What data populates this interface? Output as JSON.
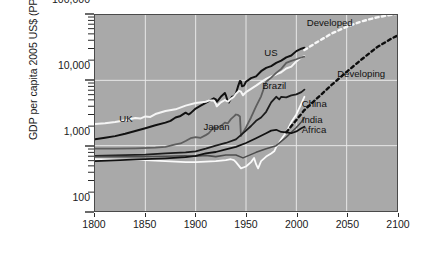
{
  "chart_data": {
    "type": "line",
    "title": "",
    "xlabel": "",
    "ylabel": "GDP per capita 2005 US$ (PPP)",
    "xlim": [
      1800,
      2100
    ],
    "ylim": [
      100,
      100000
    ],
    "yscale": "log",
    "grid": true,
    "legend_position": "inline-annotations",
    "background": "#a9a9a9",
    "gridline_color": "#e8e8e8",
    "xticks": [
      1800,
      1850,
      1900,
      1950,
      2000,
      2050,
      2100
    ],
    "xtick_labels": [
      "1800",
      "1850",
      "1900",
      "1950",
      "2000",
      "2050",
      "2100"
    ],
    "yticks": [
      100,
      1000,
      10000,
      100000
    ],
    "ytick_labels": [
      "100",
      "1,000",
      "10,000",
      "100,000"
    ],
    "annotations": [
      {
        "text": "UK",
        "x": 1825,
        "y": 2600,
        "color": "#111111"
      },
      {
        "text": "Japan",
        "x": 1908,
        "y": 1950,
        "color": "#111111"
      },
      {
        "text": "US",
        "x": 1968,
        "y": 26000,
        "color": "#111111"
      },
      {
        "text": "Brazil",
        "x": 1966,
        "y": 8200,
        "color": "#111111"
      },
      {
        "text": "China",
        "x": 2005,
        "y": 4300,
        "color": "#111111"
      },
      {
        "text": "India",
        "x": 2005,
        "y": 2450,
        "color": "#111111"
      },
      {
        "text": "Africa",
        "x": 2005,
        "y": 1750,
        "color": "#111111"
      },
      {
        "text": "Developed",
        "x": 2010,
        "y": 74000,
        "color": "#111111"
      },
      {
        "text": "Developing",
        "x": 2040,
        "y": 12500,
        "color": "#111111"
      }
    ],
    "series": [
      {
        "name": "US",
        "color": "#111111",
        "style": "solid",
        "width": 2.0,
        "points": [
          [
            1800,
            1250
          ],
          [
            1810,
            1320
          ],
          [
            1820,
            1400
          ],
          [
            1830,
            1520
          ],
          [
            1840,
            1680
          ],
          [
            1850,
            1850
          ],
          [
            1860,
            2050
          ],
          [
            1870,
            2250
          ],
          [
            1875,
            2400
          ],
          [
            1880,
            2700
          ],
          [
            1885,
            2850
          ],
          [
            1890,
            3200
          ],
          [
            1893,
            3000
          ],
          [
            1895,
            3150
          ],
          [
            1900,
            3700
          ],
          [
            1905,
            4100
          ],
          [
            1910,
            4500
          ],
          [
            1913,
            4800
          ],
          [
            1918,
            5300
          ],
          [
            1920,
            5100
          ],
          [
            1921,
            4700
          ],
          [
            1925,
            5600
          ],
          [
            1929,
            6400
          ],
          [
            1930,
            5900
          ],
          [
            1932,
            4700
          ],
          [
            1933,
            4600
          ],
          [
            1936,
            5600
          ],
          [
            1938,
            5700
          ],
          [
            1940,
            6300
          ],
          [
            1942,
            8000
          ],
          [
            1944,
            9800
          ],
          [
            1945,
            9600
          ],
          [
            1946,
            8100
          ],
          [
            1948,
            8300
          ],
          [
            1950,
            9500
          ],
          [
            1955,
            10800
          ],
          [
            1960,
            11500
          ],
          [
            1965,
            13800
          ],
          [
            1970,
            15500
          ],
          [
            1975,
            16500
          ],
          [
            1980,
            18500
          ],
          [
            1985,
            20000
          ],
          [
            1990,
            22500
          ],
          [
            1995,
            24000
          ],
          [
            2000,
            28000
          ],
          [
            2005,
            30500
          ],
          [
            2008,
            31500
          ]
        ]
      },
      {
        "name": "UK",
        "color": "#f5f5f5",
        "style": "solid",
        "width": 2.0,
        "points": [
          [
            1800,
            2150
          ],
          [
            1810,
            2200
          ],
          [
            1820,
            2300
          ],
          [
            1830,
            2450
          ],
          [
            1840,
            2650
          ],
          [
            1845,
            2600
          ],
          [
            1850,
            2800
          ],
          [
            1855,
            2750
          ],
          [
            1860,
            3050
          ],
          [
            1870,
            3400
          ],
          [
            1880,
            3600
          ],
          [
            1890,
            4100
          ],
          [
            1900,
            4500
          ],
          [
            1910,
            4700
          ],
          [
            1913,
            4900
          ],
          [
            1918,
            4900
          ],
          [
            1920,
            4400
          ],
          [
            1921,
            4000
          ],
          [
            1925,
            4600
          ],
          [
            1929,
            5000
          ],
          [
            1932,
            4700
          ],
          [
            1935,
            5200
          ],
          [
            1938,
            5600
          ],
          [
            1940,
            6200
          ],
          [
            1943,
            6900
          ],
          [
            1945,
            6700
          ],
          [
            1947,
            5900
          ],
          [
            1950,
            6600
          ],
          [
            1955,
            7400
          ],
          [
            1960,
            8300
          ],
          [
            1965,
            9400
          ],
          [
            1970,
            10500
          ],
          [
            1975,
            11500
          ],
          [
            1980,
            12300
          ],
          [
            1985,
            13300
          ],
          [
            1990,
            15200
          ],
          [
            1995,
            16200
          ],
          [
            2000,
            19500
          ],
          [
            2005,
            22500
          ],
          [
            2008,
            23500
          ]
        ]
      },
      {
        "name": "Japan",
        "color": "#5e5e5e",
        "style": "solid",
        "width": 1.8,
        "points": [
          [
            1800,
            900
          ],
          [
            1820,
            900
          ],
          [
            1840,
            910
          ],
          [
            1860,
            930
          ],
          [
            1870,
            960
          ],
          [
            1875,
            1000
          ],
          [
            1880,
            1050
          ],
          [
            1885,
            1080
          ],
          [
            1890,
            1180
          ],
          [
            1895,
            1300
          ],
          [
            1900,
            1350
          ],
          [
            1905,
            1320
          ],
          [
            1910,
            1450
          ],
          [
            1913,
            1550
          ],
          [
            1918,
            1900
          ],
          [
            1920,
            1850
          ],
          [
            1925,
            2000
          ],
          [
            1929,
            2250
          ],
          [
            1932,
            2200
          ],
          [
            1935,
            2550
          ],
          [
            1938,
            2800
          ],
          [
            1940,
            3000
          ],
          [
            1942,
            2950
          ],
          [
            1944,
            2800
          ],
          [
            1945,
            1400
          ],
          [
            1946,
            1500
          ],
          [
            1950,
            1900
          ],
          [
            1955,
            2700
          ],
          [
            1960,
            4000
          ],
          [
            1965,
            5700
          ],
          [
            1970,
            9500
          ],
          [
            1975,
            11000
          ],
          [
            1980,
            13000
          ],
          [
            1985,
            15000
          ],
          [
            1990,
            18500
          ],
          [
            1995,
            19800
          ],
          [
            2000,
            21000
          ],
          [
            2005,
            22500
          ],
          [
            2008,
            23000
          ]
        ]
      },
      {
        "name": "Brazil",
        "color": "#1c1c1c",
        "style": "solid",
        "width": 1.8,
        "points": [
          [
            1800,
            700
          ],
          [
            1850,
            730
          ],
          [
            1870,
            760
          ],
          [
            1890,
            790
          ],
          [
            1900,
            820
          ],
          [
            1910,
            900
          ],
          [
            1920,
            1000
          ],
          [
            1930,
            1100
          ],
          [
            1940,
            1250
          ],
          [
            1950,
            1700
          ],
          [
            1955,
            2000
          ],
          [
            1960,
            2400
          ],
          [
            1965,
            2700
          ],
          [
            1970,
            3300
          ],
          [
            1975,
            4600
          ],
          [
            1980,
            5600
          ],
          [
            1983,
            5100
          ],
          [
            1985,
            5600
          ],
          [
            1990,
            5500
          ],
          [
            1995,
            5900
          ],
          [
            2000,
            6100
          ],
          [
            2005,
            6600
          ],
          [
            2008,
            7200
          ]
        ]
      },
      {
        "name": "China",
        "color": "#fafafa",
        "style": "solid",
        "width": 1.8,
        "points": [
          [
            1800,
            620
          ],
          [
            1850,
            600
          ],
          [
            1870,
            580
          ],
          [
            1890,
            560
          ],
          [
            1900,
            560
          ],
          [
            1910,
            570
          ],
          [
            1920,
            580
          ],
          [
            1930,
            600
          ],
          [
            1935,
            620
          ],
          [
            1938,
            600
          ],
          [
            1940,
            560
          ],
          [
            1945,
            450
          ],
          [
            1950,
            480
          ],
          [
            1955,
            560
          ],
          [
            1958,
            650
          ],
          [
            1960,
            520
          ],
          [
            1962,
            450
          ],
          [
            1965,
            580
          ],
          [
            1970,
            680
          ],
          [
            1975,
            760
          ],
          [
            1978,
            820
          ],
          [
            1980,
            950
          ],
          [
            1985,
            1250
          ],
          [
            1990,
            1600
          ],
          [
            1995,
            2300
          ],
          [
            2000,
            3000
          ],
          [
            2005,
            4400
          ],
          [
            2008,
            5600
          ]
        ]
      },
      {
        "name": "India",
        "color": "#4d4d4d",
        "style": "solid",
        "width": 1.6,
        "points": [
          [
            1800,
            680
          ],
          [
            1850,
            680
          ],
          [
            1870,
            690
          ],
          [
            1890,
            700
          ],
          [
            1900,
            690
          ],
          [
            1910,
            710
          ],
          [
            1920,
            680
          ],
          [
            1930,
            720
          ],
          [
            1940,
            720
          ],
          [
            1947,
            650
          ],
          [
            1950,
            680
          ],
          [
            1960,
            790
          ],
          [
            1970,
            900
          ],
          [
            1980,
            1000
          ],
          [
            1990,
            1350
          ],
          [
            2000,
            1900
          ],
          [
            2005,
            2300
          ],
          [
            2008,
            2700
          ]
        ]
      },
      {
        "name": "Africa",
        "color": "#111111",
        "style": "solid",
        "width": 1.8,
        "points": [
          [
            1800,
            580
          ],
          [
            1850,
            620
          ],
          [
            1870,
            640
          ],
          [
            1890,
            670
          ],
          [
            1900,
            700
          ],
          [
            1910,
            760
          ],
          [
            1920,
            800
          ],
          [
            1930,
            880
          ],
          [
            1940,
            960
          ],
          [
            1950,
            1100
          ],
          [
            1960,
            1300
          ],
          [
            1970,
            1550
          ],
          [
            1975,
            1700
          ],
          [
            1980,
            1750
          ],
          [
            1985,
            1620
          ],
          [
            1990,
            1600
          ],
          [
            1995,
            1550
          ],
          [
            2000,
            1650
          ],
          [
            2005,
            1850
          ],
          [
            2008,
            1950
          ]
        ]
      },
      {
        "name": "Developed",
        "color": "#f7f7f7",
        "style": "dashed",
        "width": 2.4,
        "points": [
          [
            2008,
            29000
          ],
          [
            2020,
            38000
          ],
          [
            2035,
            52000
          ],
          [
            2050,
            66000
          ],
          [
            2065,
            80000
          ],
          [
            2080,
            92000
          ],
          [
            2095,
            101000
          ],
          [
            2100,
            104000
          ]
        ]
      },
      {
        "name": "Developing",
        "color": "#0d0d0d",
        "style": "dashed",
        "width": 2.4,
        "points": [
          [
            1990,
            1600
          ],
          [
            2008,
            3500
          ],
          [
            2020,
            5200
          ],
          [
            2035,
            8500
          ],
          [
            2050,
            13500
          ],
          [
            2065,
            21000
          ],
          [
            2080,
            32000
          ],
          [
            2095,
            44000
          ],
          [
            2100,
            48000
          ]
        ]
      }
    ]
  }
}
